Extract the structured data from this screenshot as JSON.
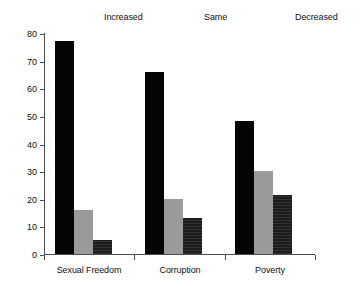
{
  "chart_data": {
    "type": "bar",
    "title": "",
    "subtitle": "",
    "xlabel": "",
    "ylabel": "",
    "categories": [
      "Sexual Freedom",
      "Corruption",
      "Poverty"
    ],
    "series": [
      {
        "name": "Increased",
        "color": "#050505",
        "values": [
          77,
          66,
          48
        ]
      },
      {
        "name": "Same",
        "color": "#9a9a9a",
        "values": [
          16,
          20,
          30
        ]
      },
      {
        "name": "Decreased",
        "color": "#1c1c1c",
        "values": [
          5,
          13,
          21.5
        ]
      }
    ],
    "ylim": [
      0,
      80
    ],
    "yticks": [
      0,
      10,
      20,
      30,
      40,
      50,
      60,
      70,
      80
    ],
    "ytick_labels": [
      "0",
      "10",
      "20",
      "30",
      "40",
      "50",
      "60",
      "70",
      "80"
    ],
    "grid": false,
    "legend_position": "top",
    "axis_color": "#4d4d4d",
    "background": "#ffffff"
  }
}
